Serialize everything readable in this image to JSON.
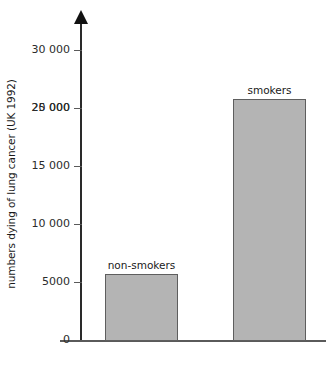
{
  "chart_data": {
    "type": "bar",
    "title": "",
    "xlabel": "",
    "ylabel": "numbers dying of lung cancer (UK 1992)",
    "categories": [
      "non-smokers",
      "smokers"
    ],
    "values": [
      5700,
      25000
    ],
    "ylim": [
      0,
      32500
    ],
    "yticks": [
      0,
      5000,
      10000,
      15000,
      20000,
      25000,
      30000
    ],
    "ytick_labels": [
      "0",
      "5000",
      "10 000",
      "15 000",
      "20 000",
      "25 000",
      "30 000"
    ],
    "grid": false,
    "legend": null,
    "bar_fill_color": "#b4b4b4",
    "bar_border_color": "#5e5e5e",
    "axis_color": "#2a2a2a",
    "background_color": "#ffffff",
    "annotations": [
      {
        "text": "non-smokers",
        "series_index": 0,
        "position": "above-bar"
      },
      {
        "text": "smokers",
        "series_index": 1,
        "position": "above-bar"
      }
    ]
  }
}
